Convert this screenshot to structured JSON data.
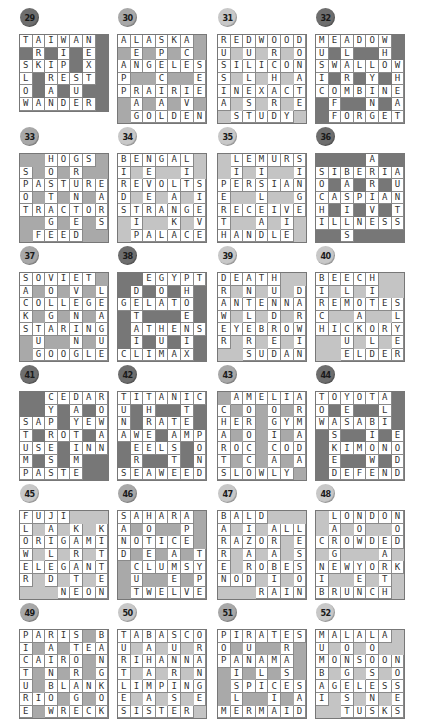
{
  "theme": {
    "dark": {
      "badge": "#6e6e6e",
      "block": "#777777",
      "number_color": "#1a1a1a"
    },
    "medium": {
      "badge": "#a8a8a8",
      "block": "#a9a9a9",
      "number_color": "#1a1a1a"
    },
    "light": {
      "badge": "#c8c8c8",
      "block": "#c4c4c4",
      "number_color": "#1a1a1a"
    }
  },
  "puzzles": [
    {
      "number": "29",
      "tone": "dark",
      "grid": [
        "TAIWAN#",
        "#R#I#E#",
        "SKIP#X#",
        "L#REST#",
        "O#A#U##",
        "WANDER#"
      ],
      "words": [
        "TAIWAN",
        "SKIP",
        "REST",
        "WANDER",
        "SLOW",
        "RIP",
        "ADD",
        "INDIA",
        "NEXT",
        "URGE"
      ]
    },
    {
      "number": "30",
      "tone": "medium",
      "grid": [
        "ALASKA#",
        "#E#P#C#",
        "ANGELES",
        "P##C##E",
        "PRAIRIE",
        "#A#A#V#",
        "#GOLDEN"
      ],
      "words": [
        "ALASKA",
        "ANGELES",
        "PRAIRIE",
        "GOLDEN",
        "APP",
        "LEAGUE",
        "SPECIAL",
        "ACRE",
        "SEE",
        "IVE",
        "EVEN"
      ]
    },
    {
      "number": "31",
      "tone": "light",
      "grid": [
        "REDWOOD",
        "U#U#R#O",
        "SILICON",
        "S#L#H#A",
        "INEXACT",
        "A#S#R#E",
        "#STUDY#"
      ],
      "words": [
        "REDWOOD",
        "SILICON",
        "INEXACT",
        "STUDY",
        "RUSSIA",
        "DULLEST",
        "ORCHARD",
        "DONATE"
      ]
    },
    {
      "number": "32",
      "tone": "dark",
      "grid": [
        "MEADOW#",
        "U#L##H#",
        "SWALLOW",
        "I#R#Y#H",
        "COMBINE",
        "#F##N#A",
        "#FORGET"
      ],
      "words": [
        "MEADOW",
        "SWALLOW",
        "COMBINE",
        "FORGET",
        "MUSIC",
        "ALARM",
        "WHOLE",
        "WHEAT",
        "EFFORT",
        "YINGYANG"
      ]
    },
    {
      "number": "33",
      "tone": "medium",
      "grid": [
        "##HOGS#",
        "S#O#R##",
        "PASTURE",
        "O#T#N#A",
        "TRACTOR",
        "##G#E#S",
        "#FEED##"
      ],
      "words": [
        "HOGS",
        "PASTURE",
        "TRACTOR",
        "FEED",
        "SPOT",
        "HOSTAGE",
        "GRANTEE",
        "EARS"
      ]
    },
    {
      "number": "34",
      "tone": "light",
      "grid": [
        "BENGAL#",
        "I#E##I#",
        "REVOLTS",
        "D#E#A#I",
        "STRANGE",
        "#I##K#V",
        "#PALACE"
      ],
      "words": [
        "BENGAL",
        "REVOLTS",
        "STRANGE",
        "PALACE",
        "BIRDS",
        "NEVER",
        "LILAK",
        "SIEVE"
      ]
    },
    {
      "number": "35",
      "tone": "light",
      "grid": [
        "#LEMURS",
        "#I#I##I",
        "PERSIAN",
        "E##L##G",
        "RECEIVE",
        "T##A#I#",
        "HANDLE#"
      ],
      "words": [
        "LEMURS",
        "PERSIAN",
        "RECEIVE",
        "HANDLE",
        "PERTH",
        "MISLEAD",
        "SIGNE",
        "LIE"
      ]
    },
    {
      "number": "36",
      "tone": "dark",
      "grid": [
        "####A##",
        "SIBERIA",
        "O#A#R#U",
        "CASPIAN",
        "H#I#V#T",
        "ILLNESS",
        "##S####"
      ],
      "words": [
        "SIBERIA",
        "CASPIAN",
        "ILLNESS",
        "SOCHI",
        "BASILS",
        "ARRIVE",
        "AUNTS"
      ]
    },
    {
      "number": "37",
      "tone": "medium",
      "grid": [
        "SOVIET#",
        "A#O#V#L",
        "COLLEGE",
        "K#G#N#A",
        "STARING",
        "#U##N#U",
        "#GOOGLE"
      ],
      "words": [
        "SOVIET",
        "COLLEGE",
        "STARING",
        "GOOGLE",
        "SACKS",
        "VOLGA",
        "EVENING",
        "LEAGUE"
      ]
    },
    {
      "number": "38",
      "tone": "dark",
      "grid": [
        "##EGYPT",
        "#D#O#H#",
        "GELATO#",
        "#T###E#",
        "#ATHENS",
        "#I#U#I#",
        "CLIMAX#"
      ],
      "words": [
        "EGYPT",
        "GELATO",
        "ATHENS",
        "CLIMAX",
        "DETAIL",
        "GOAT",
        "HUM",
        "PHOENIX"
      ]
    },
    {
      "number": "39",
      "tone": "light",
      "grid": [
        "DEATH##",
        "R#N#U#D",
        "ANTENNA",
        "W#L#D#R",
        "EYEBROW",
        "R#R#E#I",
        "##SUDAN"
      ],
      "words": [
        "DEATH",
        "ANTENNA",
        "EYEBROW",
        "SUDAN",
        "DRAWER",
        "ANTLERS",
        "HUDDEN",
        "DARWIN"
      ]
    },
    {
      "number": "40",
      "tone": "light",
      "grid": [
        "BEECH##",
        "I#L#I##",
        "REMOTES",
        "C##A##L",
        "HICKORY",
        "##U#L#E",
        "##ELDER"
      ],
      "words": [
        "BEECH",
        "REMOTES",
        "HICKORY",
        "ELDER",
        "BIRCH",
        "ELM",
        "HIKE",
        "ACORN",
        "SLYER",
        "DUCE"
      ]
    },
    {
      "number": "41",
      "tone": "dark",
      "grid": [
        "##CEDAR",
        "##Y#A#O",
        "SAP#YEW",
        "T#ROT#A",
        "USE#INN",
        "M#S#M##",
        "PASTE##"
      ],
      "words": [
        "CEDAR",
        "SAP",
        "YEW",
        "ROT",
        "USE",
        "INN",
        "PASTE",
        "STUMP",
        "CYPRESS",
        "DAYTIME",
        "ROWAN"
      ]
    },
    {
      "number": "42",
      "tone": "dark",
      "grid": [
        "TITANIC",
        "U#H##T#",
        "N#RATE#",
        "AWE#AMP",
        "#EELS#O",
        "#R##T#N",
        "SEAWEED"
      ],
      "words": [
        "TITANIC",
        "RATE",
        "AWE",
        "AMP",
        "EELS",
        "SEAWEED",
        "TUNA",
        "THREE",
        "WEIRS",
        "ITE",
        "PON"
      ]
    },
    {
      "number": "43",
      "tone": "medium",
      "grid": [
        "#AMELIA",
        "C#O#O#R",
        "HER#GYM",
        "A#O#I#A",
        "ROC#COD",
        "T#C#A#A",
        "SLOWLY#"
      ],
      "words": [
        "AMELIA",
        "HER",
        "GYM",
        "ROC",
        "COD",
        "SLOWLY",
        "CHARTS",
        "MOROCCO",
        "LOGICAL",
        "ARMADA"
      ]
    },
    {
      "number": "44",
      "tone": "dark",
      "grid": [
        "TOYOTA#",
        "O#E##L#",
        "WASABI#",
        "#S##I#E",
        "#KIMONO",
        "#E##W#D",
        "#DEFEND"
      ],
      "words": [
        "TOYOTA",
        "WASABI",
        "KIMONO",
        "DEFEND",
        "TOW",
        "ASKED",
        "ALIBI",
        "ODD"
      ]
    },
    {
      "number": "45",
      "tone": "light",
      "grid": [
        "FUJI###",
        "L#A#K#K",
        "ORIGAMI",
        "W#L#R#T",
        "ELEGANT",
        "R#D#T#E",
        "###NEON"
      ],
      "words": [
        "FUJI",
        "ORIGAMI",
        "ELEGANT",
        "NEON",
        "FLOWER",
        "JAILED",
        "KARATE",
        "KITTEN"
      ]
    },
    {
      "number": "46",
      "tone": "medium",
      "grid": [
        "SAHARA#",
        "A#O##P#",
        "NOTICE#",
        "D#E#A#T",
        "#CLUMSY",
        "#U##E#P",
        "#TWELVE"
      ],
      "words": [
        "SAHARA",
        "NOTICE",
        "CLUMSY",
        "TWELVE",
        "SAND",
        "HOTEL",
        "CUT",
        "APE",
        "TYPE"
      ]
    },
    {
      "number": "47",
      "tone": "light",
      "grid": [
        "BALD###",
        "A#I#ALL",
        "RAZOR#E",
        "R#A#A#S",
        "E#ROBES",
        "NOD#I#O",
        "###RAIN"
      ],
      "words": [
        "BALD",
        "ALL",
        "RAZOR",
        "ROBES",
        "NOD",
        "RAIN",
        "BARREN",
        "LIZARD",
        "ARABIA",
        "LESSON"
      ]
    },
    {
      "number": "48",
      "tone": "light",
      "grid": [
        "#LONDON",
        "#A#O##O",
        "CROWDED",
        "#G###A#",
        "NEWYORK",
        "I##E#T#",
        "BRUNCH#"
      ],
      "words": [
        "LONDON",
        "CROWDED",
        "NEWYORK",
        "BRUNCH",
        "LAGER",
        "NIB",
        "DOWNY",
        "NOD",
        "HEART",
        "YEN"
      ]
    },
    {
      "number": "49",
      "tone": "medium",
      "grid": [
        "PARIS#B",
        "I#A#TEA",
        "CAIRO#N",
        "T#N#R#G",
        "U#BLANK",
        "RIO#G#O",
        "E#WRECK"
      ],
      "words": [
        "PARIS",
        "TEA",
        "CAIRO",
        "BLANK",
        "RIO",
        "WRECK",
        "PICTURE",
        "RAINBOW",
        "STORAGE",
        "BANGKOK"
      ]
    },
    {
      "number": "50",
      "tone": "light",
      "grid": [
        "TABASCO",
        "U#A#U#R",
        "RIHANNA",
        "T#A#R#N",
        "LIMPING",
        "E#A#S#E",
        "SISTER#"
      ],
      "words": [
        "TABASCO",
        "RIHANNA",
        "LIMPING",
        "SISTER",
        "TURTLES",
        "BAHAMAS",
        "NURSE",
        "ORANGE"
      ]
    },
    {
      "number": "51",
      "tone": "medium",
      "grid": [
        "PIRATES",
        "O#U##R#",
        "PANAMA#",
        "#I#L#S#",
        "#SPICES",
        "#L##I#A",
        "MERMAID"
      ],
      "words": [
        "PIRATES",
        "PANAMA",
        "SPICES",
        "MERMAID",
        "POP",
        "RUM",
        "ERASE",
        "ISLAM",
        "SAD",
        "AILS"
      ]
    },
    {
      "number": "52",
      "tone": "light",
      "grid": [
        "MALALA#",
        "U#O#O##",
        "MONSOON",
        "B#G#S#O",
        "AGELESS",
        "I#S#N#E",
        "##TUSKS"
      ],
      "words": [
        "MALALA",
        "MONSOON",
        "AGELESS",
        "TUSKS",
        "MUMBAI",
        "LOGS",
        "LOSENS",
        "NOSES"
      ]
    }
  ]
}
